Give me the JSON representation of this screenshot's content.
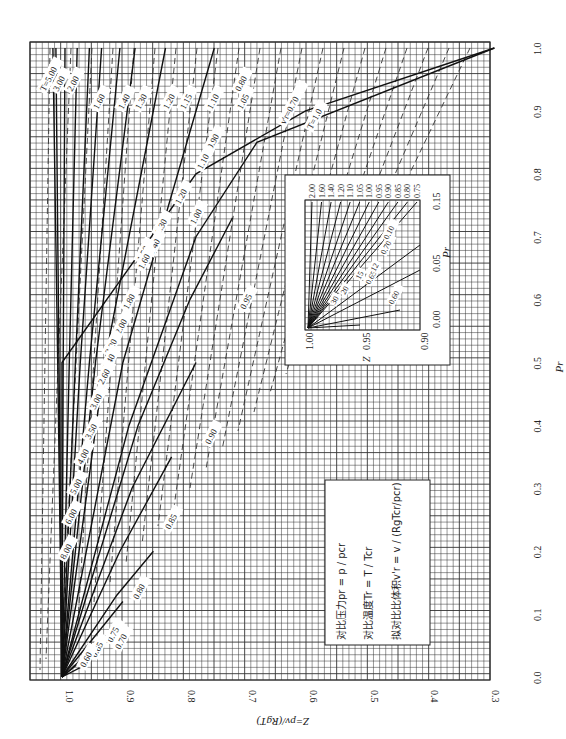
{
  "figure": {
    "caption": "(a) 0<pr<1.0",
    "x_axis_label": "Pr",
    "y_axis_label": "Z=pv/(RgT)",
    "orientation": "rotated 90° counter-clockwise on page"
  },
  "legend_box": {
    "line1": "对比压力pr = p / pcr",
    "line2": "对比温度Tr = T / Tcr",
    "line3": "拟对比比体积v'r = v / (RgTcr/pcr)"
  },
  "inset": {
    "x_label": "Pr",
    "y_label": "Z",
    "x_ticks": [
      "0.00",
      "0.05",
      "0.15"
    ],
    "y_ticks": [
      "1.00",
      "0.95",
      "0.90"
    ],
    "top_labels": [
      "2.00",
      "1.60",
      "1.40",
      "1.20",
      "1.10",
      "1.05",
      "1.00",
      "0.95",
      "0.90",
      "0.85",
      "0.80",
      "0.75"
    ],
    "inner_labels": [
      "0.60",
      "0.65",
      "0.70",
      "0.10",
      "12",
      "15",
      "20",
      "30"
    ]
  },
  "chart_data": {
    "type": "line",
    "xlabel": "Pr",
    "ylabel": "Z=pv/(RgT)",
    "xlim": [
      0.0,
      1.0
    ],
    "ylim": [
      0.3,
      1.05
    ],
    "grid": true,
    "x_ticks": [
      "0.0",
      "0.1",
      "0.2",
      "0.3",
      "0.4",
      "0.5",
      "0.6",
      "0.7",
      "0.8",
      "0.9",
      "1.0"
    ],
    "y_ticks": [
      "1.0",
      "0.9",
      "0.8",
      "0.7",
      "0.6",
      "0.5",
      "0.4",
      "0.3"
    ],
    "series_Tr": [
      {
        "name": "Tr=0.60",
        "x": [
          0.0,
          0.02
        ],
        "y": [
          1.0,
          0.96
        ]
      },
      {
        "name": "Tr=0.65",
        "x": [
          0.0,
          0.04
        ],
        "y": [
          1.0,
          0.95
        ]
      },
      {
        "name": "Tr=0.70",
        "x": [
          0.0,
          0.07
        ],
        "y": [
          1.0,
          0.92
        ]
      },
      {
        "name": "Tr=0.75",
        "x": [
          0.0,
          0.12
        ],
        "y": [
          1.0,
          0.9
        ]
      },
      {
        "name": "Tr=0.80",
        "x": [
          0.0,
          0.13,
          0.2
        ],
        "y": [
          1.0,
          0.91,
          0.85
        ]
      },
      {
        "name": "Tr=0.85",
        "x": [
          0.0,
          0.2,
          0.35
        ],
        "y": [
          1.0,
          0.905,
          0.82
        ]
      },
      {
        "name": "Tr=0.90",
        "x": [
          0.0,
          0.3,
          0.5
        ],
        "y": [
          1.0,
          0.885,
          0.78
        ]
      },
      {
        "name": "Tr=0.95",
        "x": [
          0.0,
          0.4,
          0.6,
          0.73
        ],
        "y": [
          1.0,
          0.875,
          0.79,
          0.72
        ]
      },
      {
        "name": "Tr=1.0",
        "x": [
          0.0,
          0.4,
          0.7,
          0.85,
          1.0
        ],
        "y": [
          1.0,
          0.89,
          0.78,
          0.68,
          0.29
        ]
      },
      {
        "name": "Tr=1.05",
        "x": [
          0.0,
          0.5,
          1.0
        ],
        "y": [
          1.0,
          0.9,
          0.75
        ]
      },
      {
        "name": "Tr=1.10",
        "x": [
          0.0,
          0.5,
          1.0
        ],
        "y": [
          1.0,
          0.93,
          0.83
        ]
      },
      {
        "name": "Tr=1.15",
        "x": [
          0.0,
          0.5,
          1.0
        ],
        "y": [
          1.0,
          0.945,
          0.88
        ]
      },
      {
        "name": "Tr=1.20",
        "x": [
          0.0,
          0.5,
          1.0
        ],
        "y": [
          1.0,
          0.955,
          0.905
        ]
      },
      {
        "name": "Tr=1.30",
        "x": [
          0.0,
          0.5,
          1.0
        ],
        "y": [
          1.0,
          0.97,
          0.935
        ]
      },
      {
        "name": "Tr=1.40",
        "x": [
          0.0,
          0.5,
          1.0
        ],
        "y": [
          1.0,
          0.978,
          0.955
        ]
      },
      {
        "name": "Tr=1.60",
        "x": [
          0.0,
          0.5,
          1.0
        ],
        "y": [
          1.0,
          0.988,
          0.975
        ]
      },
      {
        "name": "Tr=2.00",
        "x": [
          0.0,
          0.5,
          1.0
        ],
        "y": [
          1.0,
          0.998,
          0.995
        ]
      },
      {
        "name": "Tr=3.00",
        "x": [
          0.0,
          0.5,
          1.0
        ],
        "y": [
          1.0,
          1.005,
          1.01
        ]
      },
      {
        "name": "Tr=5.00",
        "x": [
          0.0,
          0.5,
          1.0
        ],
        "y": [
          1.0,
          1.007,
          1.015
        ]
      },
      {
        "name": "Tr=1.0 (lower branch)",
        "x": [
          0.0,
          0.5,
          0.8,
          0.9,
          1.0
        ],
        "y": [
          1.0,
          1.0,
          0.78,
          0.6,
          0.29
        ]
      }
    ],
    "series_vr_dashed": [
      {
        "name": "v'r=0.70"
      },
      {
        "name": "v'r=0.80"
      },
      {
        "name": "v'r=0.90"
      },
      {
        "name": "v'r=1.00"
      },
      {
        "name": "v'r=1.10"
      },
      {
        "name": "v'r=1.20"
      },
      {
        "name": "v'r=1.30"
      },
      {
        "name": "v'r=1.40"
      },
      {
        "name": "v'r=1.50"
      },
      {
        "name": "v'r=1.60"
      },
      {
        "name": "v'r=1.80"
      },
      {
        "name": "v'r=2.00"
      },
      {
        "name": "v'r=2.20"
      },
      {
        "name": "v'r=2.40"
      },
      {
        "name": "v'r=2.60"
      },
      {
        "name": "v'r=3.00"
      },
      {
        "name": "v'r=3.50"
      },
      {
        "name": "v'r=4.00"
      },
      {
        "name": "v'r=5.00"
      },
      {
        "name": "v'r=6.00"
      },
      {
        "name": "v'r=8.00"
      }
    ],
    "curve_labels_Tr": [
      "T=5.00",
      "3.00",
      "2.00",
      "1.60",
      "1.40",
      "1.30",
      "1.20",
      "1.15",
      "1.10",
      "1.05",
      "T=1.0",
      "0.95",
      "0.90",
      "0.85",
      "0.80",
      "0.75",
      "0.70",
      "0.65",
      "0.60"
    ],
    "curve_labels_vr": [
      "v'r=0.70",
      "0.80",
      "0.90",
      "1.00",
      "1.10",
      "1.20",
      "1.30",
      "1.40",
      "1.50",
      "1.60",
      "1.80",
      "2.00",
      "2.20",
      "2.40",
      "2.60",
      "3.00",
      "3.50",
      "4.00",
      "5.00",
      "6.00",
      "8.00"
    ]
  }
}
